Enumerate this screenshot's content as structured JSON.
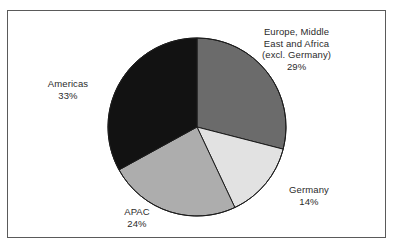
{
  "figure": {
    "background_color": "#ffffff",
    "frame_color": "#5a5a5a"
  },
  "chart_data": {
    "type": "pie",
    "title": "",
    "subtitle": "",
    "xlabel": "",
    "ylabel": "",
    "grid": false,
    "legend_position": "none",
    "label_style": "outside-callout-text",
    "start_angle_deg": 0,
    "direction": "clockwise",
    "categories": [
      "Europe, Middle East and Africa (excl. Germany)",
      "Germany",
      "APAC",
      "Americas"
    ],
    "values": [
      29,
      14,
      24,
      33
    ],
    "unit": "%",
    "total": 100,
    "slices": [
      {
        "name": "Europe, Middle East and Africa (excl. Germany)",
        "label_lines": [
          "Europe, Middle",
          "East and Africa",
          "(excl. Germany)"
        ],
        "value": 29,
        "value_text": "29%",
        "color": "#6b6b6b",
        "start_deg": 0,
        "end_deg": 104.4
      },
      {
        "name": "Germany",
        "label_lines": [
          "Germany"
        ],
        "value": 14,
        "value_text": "14%",
        "color": "#e2e2e2",
        "start_deg": 104.4,
        "end_deg": 154.8
      },
      {
        "name": "APAC",
        "label_lines": [
          "APAC"
        ],
        "value": 24,
        "value_text": "24%",
        "color": "#adadad",
        "start_deg": 154.8,
        "end_deg": 241.2
      },
      {
        "name": "Americas",
        "label_lines": [
          "Americas"
        ],
        "value": 33,
        "value_text": "33%",
        "color": "#121212",
        "start_deg": 241.2,
        "end_deg": 360
      }
    ]
  },
  "labels": {
    "emea": {
      "line1": "Europe, Middle",
      "line2": "East and Africa",
      "line3": "(excl. Germany)",
      "percent": "29%"
    },
    "americas": {
      "line1": "Americas",
      "percent": "33%"
    },
    "apac": {
      "line1": "APAC",
      "percent": "24%"
    },
    "germany": {
      "line1": "Germany",
      "percent": "14%"
    }
  }
}
